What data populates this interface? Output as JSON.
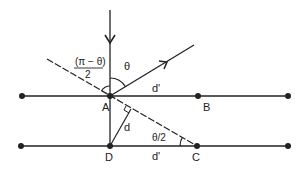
{
  "diagram": {
    "colors": {
      "stroke": "#222222",
      "background": "#ffffff"
    },
    "points": {
      "A": {
        "label": "A",
        "x": 110,
        "y": 96
      },
      "B": {
        "label": "B",
        "x": 198,
        "y": 96
      },
      "C": {
        "label": "C",
        "x": 197,
        "y": 146
      },
      "D": {
        "label": "D",
        "x": 110,
        "y": 146
      },
      "upper_left_end": {
        "x": 22,
        "y": 96
      },
      "upper_right_end": {
        "x": 288,
        "y": 96
      },
      "lower_left_end": {
        "x": 21,
        "y": 146
      },
      "lower_right_end": {
        "x": 288,
        "y": 146
      }
    },
    "labels": {
      "angle_theta": "θ",
      "angle_half_num": "(π − θ)",
      "angle_half_den": "2",
      "angle_theta_half": "θ/2",
      "distance_d": "d",
      "distance_d_prime_top": "d'",
      "distance_d_prime_bottom": "d'"
    }
  }
}
